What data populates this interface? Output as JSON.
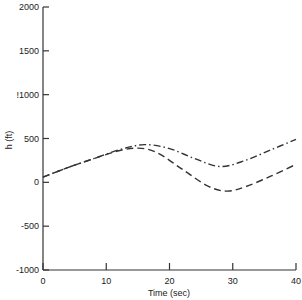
{
  "chart_data": {
    "type": "line",
    "title": "",
    "xlabel": "Time (sec)",
    "ylabel": "h (ft)",
    "xlim": [
      0,
      40
    ],
    "ylim": [
      -1000,
      2000
    ],
    "x_ticks": [
      0,
      10,
      20,
      30,
      40
    ],
    "x_tick_labels": [
      "0",
      "10",
      "20",
      "30",
      "40"
    ],
    "y_ticks": [
      2000,
      1500,
      1000,
      500,
      0,
      -500,
      -1000
    ],
    "y_tick_labels": [
      "2000",
      "1500",
      "!1000",
      "500",
      "0",
      "-500",
      "-1000"
    ],
    "grid": false,
    "legend": null,
    "series": [
      {
        "name": "dash-dot curve",
        "style": "dash-dot",
        "color": "#333333",
        "x": [
          0,
          4,
          8,
          12,
          16,
          20,
          24,
          28,
          32,
          36,
          40
        ],
        "y": [
          60,
          170,
          270,
          370,
          430,
          385,
          270,
          180,
          250,
          370,
          490
        ]
      },
      {
        "name": "dashed curve",
        "style": "dashed",
        "color": "#333333",
        "x": [
          0,
          4,
          8,
          12,
          15,
          18,
          22,
          26,
          29,
          32,
          36,
          40
        ],
        "y": [
          60,
          170,
          270,
          360,
          390,
          340,
          150,
          -40,
          -100,
          -50,
          70,
          205
        ]
      }
    ]
  }
}
